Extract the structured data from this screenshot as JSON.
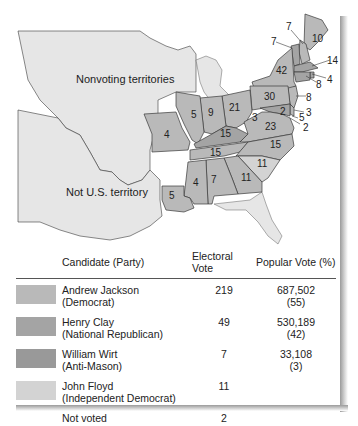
{
  "map": {
    "labels": {
      "nonvoting": "Nonvoting territories",
      "not_us": "Not U.S. territory"
    },
    "colors": {
      "jackson": "#b9b9b9",
      "clay": "#a4a4a4",
      "wirt": "#999999",
      "floyd": "#d3d3d3",
      "territory": "#e6e6e6",
      "water": "#ffffff",
      "border": "#3a3a3a"
    },
    "states": [
      {
        "name": "Maine",
        "ev": "10"
      },
      {
        "name": "New Hampshire",
        "ev": "7"
      },
      {
        "name": "Vermont",
        "ev": "7"
      },
      {
        "name": "Massachusetts",
        "ev": "14"
      },
      {
        "name": "Rhode Island",
        "ev": "4"
      },
      {
        "name": "Connecticut",
        "ev": "8"
      },
      {
        "name": "New York",
        "ev": "42"
      },
      {
        "name": "New Jersey",
        "ev": "8"
      },
      {
        "name": "Pennsylvania",
        "ev": "30"
      },
      {
        "name": "Delaware",
        "ev": "3"
      },
      {
        "name": "Maryland",
        "ev": "5"
      },
      {
        "name": "Maryland (split)",
        "ev": "2"
      },
      {
        "name": "Maryland (Clay)",
        "ev": "3"
      },
      {
        "name": "Ohio",
        "ev": "21"
      },
      {
        "name": "Indiana",
        "ev": "9"
      },
      {
        "name": "Illinois",
        "ev": "5"
      },
      {
        "name": "Missouri",
        "ev": "4"
      },
      {
        "name": "Kentucky",
        "ev": "15"
      },
      {
        "name": "Virginia",
        "ev": "23"
      },
      {
        "name": "North Carolina",
        "ev": "15"
      },
      {
        "name": "Tennessee",
        "ev": "15"
      },
      {
        "name": "South Carolina",
        "ev": "11"
      },
      {
        "name": "Georgia",
        "ev": "11"
      },
      {
        "name": "Alabama",
        "ev": "7"
      },
      {
        "name": "Mississippi",
        "ev": "4"
      },
      {
        "name": "Louisiana",
        "ev": "5"
      },
      {
        "name": "Virginia small",
        "ev": "2"
      }
    ]
  },
  "legend": {
    "headers": {
      "candidate": "Candidate (Party)",
      "electoral": "Electoral Vote",
      "popular": "Popular Vote (%)"
    },
    "rows": [
      {
        "name": "Andrew Jackson",
        "party": "(Democrat)",
        "ev": "219",
        "pv": "687,502",
        "pct": "(55)",
        "color": "#b9b9b9"
      },
      {
        "name": "Henry Clay",
        "party": "(National Republican)",
        "ev": "49",
        "pv": "530,189",
        "pct": "(42)",
        "color": "#a4a4a4"
      },
      {
        "name": "William Wirt",
        "party": "(Anti-Mason)",
        "ev": "7",
        "pv": "33,108",
        "pct": "(3)",
        "color": "#999999"
      },
      {
        "name": "John Floyd",
        "party": "(Independent Democrat)",
        "ev": "11",
        "pv": "",
        "pct": "",
        "color": "#d3d3d3"
      },
      {
        "name": "Not voted",
        "party": "",
        "ev": "2",
        "pv": "",
        "pct": "",
        "color": ""
      }
    ]
  }
}
